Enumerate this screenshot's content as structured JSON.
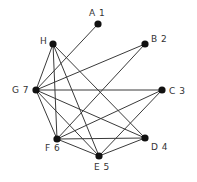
{
  "diagram": {
    "type": "graph",
    "directed": false,
    "colors": {
      "node": "#111111",
      "edge": "#3a3a3a",
      "label": "#333333",
      "background": "#ffffff"
    },
    "nodes": [
      {
        "id": "A1",
        "label": "A 1",
        "x": 98,
        "y": 24,
        "lx": 89,
        "ly": 16,
        "anchor": "start"
      },
      {
        "id": "H",
        "label": "H",
        "x": 53,
        "y": 44,
        "lx": 40,
        "ly": 44,
        "anchor": "start"
      },
      {
        "id": "B2",
        "label": "B 2",
        "x": 145,
        "y": 44,
        "lx": 151,
        "ly": 42,
        "anchor": "start"
      },
      {
        "id": "G7",
        "label": "G 7",
        "x": 36,
        "y": 90,
        "lx": 12,
        "ly": 93,
        "anchor": "start"
      },
      {
        "id": "C3",
        "label": "C 3",
        "x": 162,
        "y": 90,
        "lx": 169,
        "ly": 94,
        "anchor": "start"
      },
      {
        "id": "F6",
        "label": "F 6",
        "x": 57,
        "y": 139,
        "lx": 45,
        "ly": 151,
        "anchor": "start"
      },
      {
        "id": "D4",
        "label": "D 4",
        "x": 145,
        "y": 138,
        "lx": 151,
        "ly": 150,
        "anchor": "start"
      },
      {
        "id": "E5",
        "label": "E 5",
        "x": 99,
        "y": 156,
        "lx": 94,
        "ly": 170,
        "anchor": "start"
      }
    ],
    "edges": [
      [
        "A1",
        "G7"
      ],
      [
        "B2",
        "G7"
      ],
      [
        "B2",
        "F6"
      ],
      [
        "C3",
        "G7"
      ],
      [
        "C3",
        "F6"
      ],
      [
        "C3",
        "E5"
      ],
      [
        "D4",
        "H"
      ],
      [
        "D4",
        "G7"
      ],
      [
        "D4",
        "F6"
      ],
      [
        "D4",
        "E5"
      ],
      [
        "E5",
        "H"
      ],
      [
        "E5",
        "G7"
      ],
      [
        "E5",
        "F6"
      ],
      [
        "F6",
        "H"
      ],
      [
        "F6",
        "G7"
      ],
      [
        "G7",
        "H"
      ]
    ]
  }
}
